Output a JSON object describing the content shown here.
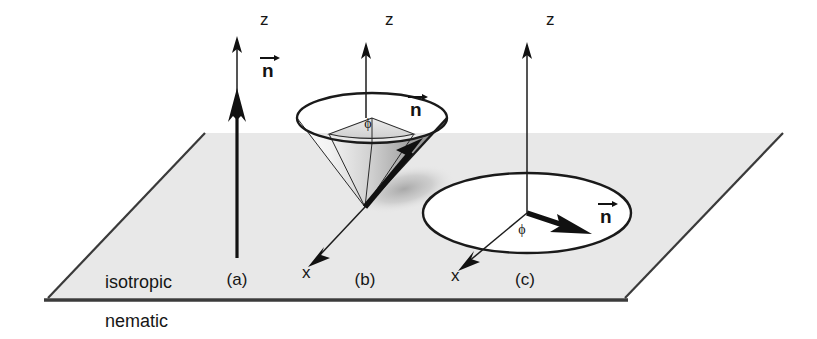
{
  "figure": {
    "background_color": "#ffffff",
    "ink_color": "#161616",
    "plane_fill_color": "#e8e8e8",
    "cone_shade_color": "#b9b9b9"
  },
  "phases": {
    "upper_label": "isotropic",
    "lower_label": "nematic"
  },
  "panels": [
    {
      "id": "a",
      "label": "(a)",
      "label_x": 237,
      "label_y": 285,
      "axis_z_label": "z",
      "axis_z_label_x": 260,
      "axis_z_label_y": 25,
      "axis_x_label": "",
      "director_label": "n",
      "director_label_x": 266,
      "director_label_y": 75,
      "phi_label": "",
      "description": "director n normal to the interface, along z"
    },
    {
      "id": "b",
      "label": "(b)",
      "label_x": 365,
      "label_y": 285,
      "axis_z_label": "z",
      "axis_z_label_x": 385,
      "axis_z_label_y": 25,
      "axis_x_label": "x",
      "axis_x_label_x": 302,
      "axis_x_label_y": 275,
      "director_label": "n",
      "director_label_x": 412,
      "director_label_y": 115,
      "phi_label": "ϕ",
      "phi_label_x": 368,
      "phi_label_y": 127,
      "description": "director n tilted on a cone of fixed polar angle, azimuth phi free"
    },
    {
      "id": "c",
      "label": "(c)",
      "label_x": 525,
      "label_y": 285,
      "axis_z_label": "z",
      "axis_z_label_x": 546,
      "axis_z_label_y": 25,
      "axis_x_label": "x",
      "axis_x_label_x": 451,
      "axis_x_label_y": 278,
      "director_label": "n",
      "director_label_x": 600,
      "director_label_y": 222,
      "phi_label": "ϕ",
      "phi_label_x": 522,
      "phi_label_y": 233,
      "description": "director n lying in the interface plane, azimuth phi free"
    }
  ],
  "geometry": {
    "plane": {
      "left_corner": [
        48,
        298
      ],
      "bottom_right_corner": [
        625,
        298
      ],
      "top_right_corner": [
        783,
        133
      ],
      "top_left_corner": [
        205,
        133
      ]
    },
    "interface_line": {
      "x1": 44,
      "y1": 300,
      "x2": 628,
      "y2": 300
    },
    "panel_a": {
      "axis_base": [
        237,
        258
      ],
      "axis_tip": [
        237,
        38
      ],
      "director_head_y": 100
    },
    "panel_b": {
      "cone_apex": [
        365,
        207
      ],
      "cone_rim_center": [
        372,
        118
      ],
      "cone_rim_rx": 75,
      "cone_rim_ry": 25,
      "axis_tip": [
        366,
        42
      ],
      "x_axis_end": [
        311,
        264
      ],
      "director_tip": [
        421,
        139
      ]
    },
    "panel_c": {
      "ellipse_center": [
        527,
        213
      ],
      "ellipse_rx": 104,
      "ellipse_ry": 40,
      "axis_tip": [
        527,
        42
      ],
      "x_axis_end": [
        461,
        269
      ],
      "director_tip": [
        589,
        233
      ]
    }
  }
}
